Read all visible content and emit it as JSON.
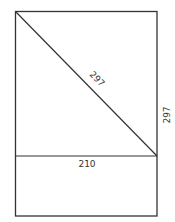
{
  "diagram": {
    "type": "paper-size-geometry",
    "canvas": {
      "width": 175,
      "height": 222
    },
    "stroke_color": "#333333",
    "outer_rect": {
      "x1": 15,
      "y1": 11,
      "x2": 157,
      "y2": 216
    },
    "divider_line": {
      "x1": 15,
      "y1": 156,
      "x2": 157,
      "y2": 156
    },
    "diagonal_line": {
      "x1": 15,
      "y1": 11,
      "x2": 157,
      "y2": 156
    },
    "labels": {
      "diagonal": "297",
      "width": "210",
      "height": "297"
    }
  }
}
